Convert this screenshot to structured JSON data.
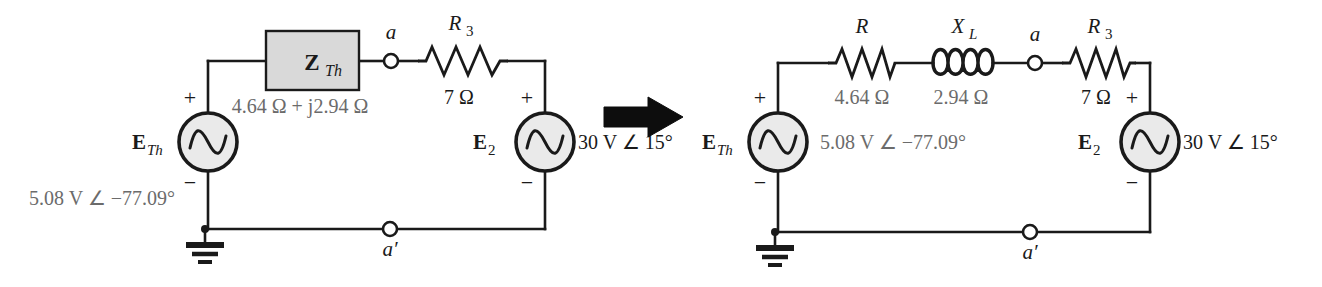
{
  "figure": {
    "type": "electrical-circuit-diagram",
    "transform_arrow": "arrow-right"
  },
  "colors": {
    "wire": "#1a1a1a",
    "component_fill": "#d9d9d9",
    "node_fill": "#ffffff",
    "value_gray": "#6b6b6b",
    "text_black": "#1a1a1a",
    "background": "#ffffff"
  },
  "left_circuit": {
    "name": "thevenin-block-circuit",
    "source_eth": {
      "symbol_label": "E",
      "symbol_sub": "Th",
      "value": "5.08 V ∠ −77.09°",
      "plus": "+",
      "minus": "−"
    },
    "impedance_block": {
      "symbol_label": "Z",
      "symbol_sub": "Th",
      "value": "4.64 Ω  +  j2.94 Ω"
    },
    "resistor_r3": {
      "symbol_label": "R",
      "symbol_sub": "3",
      "value": "7 Ω"
    },
    "source_e2": {
      "symbol_label": "E",
      "symbol_sub": "2",
      "value": "30 V ∠ 15°",
      "plus": "+",
      "minus": "−"
    },
    "node_a": "a",
    "node_a_prime": "a′",
    "ground": "ground-symbol"
  },
  "right_circuit": {
    "name": "expanded-series-circuit",
    "source_eth": {
      "symbol_label": "E",
      "symbol_sub": "Th",
      "value": "5.08 V ∠ −77.09°",
      "plus": "+",
      "minus": "−"
    },
    "resistor_r": {
      "symbol_label": "R",
      "symbol_sub": "",
      "value": "4.64 Ω"
    },
    "inductor_xl": {
      "symbol_label": "X",
      "symbol_sub": "L",
      "value": "2.94 Ω"
    },
    "resistor_r3": {
      "symbol_label": "R",
      "symbol_sub": "3",
      "value": "7 Ω"
    },
    "source_e2": {
      "symbol_label": "E",
      "symbol_sub": "2",
      "value": "30 V ∠ 15°",
      "plus": "+",
      "minus": "−"
    },
    "node_a": "a",
    "node_a_prime": "a′",
    "ground": "ground-symbol"
  }
}
